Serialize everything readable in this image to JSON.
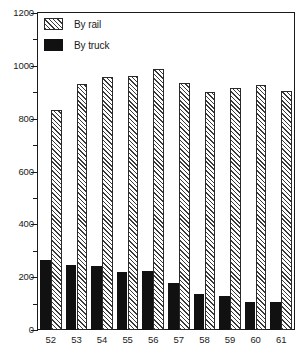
{
  "chart_data": {
    "type": "bar",
    "title": "",
    "subtitle": "",
    "xlabel": "",
    "ylabel": "",
    "categories": [
      "52",
      "53",
      "54",
      "55",
      "56",
      "57",
      "58",
      "59",
      "60",
      "61"
    ],
    "series": [
      {
        "name": "By truck",
        "style": "solid-black",
        "color": "#111111",
        "values": [
          265,
          248,
          243,
          218,
          222,
          177,
          138,
          128,
          107,
          105
        ]
      },
      {
        "name": "By rail",
        "style": "diagonal-hatch",
        "color": "#3a3a3a",
        "values": [
          833,
          930,
          958,
          963,
          988,
          935,
          902,
          918,
          928,
          903
        ]
      }
    ],
    "ylim": [
      0,
      1200
    ],
    "y_major_ticks": [
      0,
      200,
      400,
      600,
      800,
      1000,
      1200
    ],
    "y_minor_ticks": [
      100,
      300,
      500,
      700,
      900,
      1100
    ],
    "y_tick_labels": [
      "0",
      "200",
      "400",
      "600",
      "800",
      "1000",
      "1200"
    ],
    "grid": false,
    "legend_position": "top-left",
    "legend": [
      "By rail",
      "By truck"
    ],
    "frame_color": "#1a1a1a",
    "background": "#ffffff"
  },
  "legend": {
    "entries": [
      {
        "label": "By rail",
        "swatch": "hatched-swatch-icon"
      },
      {
        "label": "By truck",
        "swatch": "solid-swatch-icon"
      }
    ]
  }
}
